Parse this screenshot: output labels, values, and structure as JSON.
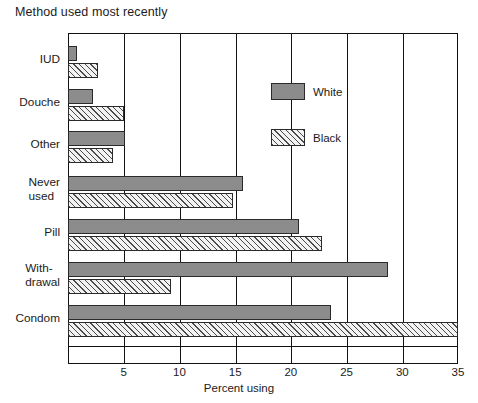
{
  "chart_data": {
    "type": "bar",
    "orientation": "horizontal",
    "title": "Method used most recently",
    "xlabel": "Percent using",
    "ylabel": "",
    "xlim": [
      0,
      35
    ],
    "xticks": [
      5,
      10,
      15,
      20,
      25,
      30,
      35
    ],
    "xticklabels": [
      "5",
      "10",
      "15",
      "20",
      "25",
      "30",
      "35"
    ],
    "grid": true,
    "grid_axis": "x",
    "legend_position": "upper-center-inside",
    "categories": [
      "IUD",
      "Douche",
      "Other",
      "Never used",
      "Pill",
      "With-drawal",
      "Condom"
    ],
    "category_label_lines": [
      [
        "IUD"
      ],
      [
        "Douche"
      ],
      [
        "Other"
      ],
      [
        "Never",
        "used"
      ],
      [
        "Pill"
      ],
      [
        "With-",
        "drawal"
      ],
      [
        "Condom"
      ]
    ],
    "series": [
      {
        "name": "White",
        "fill": "solid-gray",
        "color": "#8c8c8c",
        "values": [
          0.8,
          2.2,
          5.1,
          15.7,
          20.7,
          28.7,
          23.6
        ]
      },
      {
        "name": "Black",
        "fill": "diagonal-hatch",
        "color": "#f2f2f2",
        "values": [
          2.7,
          5.0,
          4.0,
          14.8,
          22.8,
          9.2,
          35.0
        ]
      }
    ]
  },
  "legend": {
    "entries": [
      {
        "label": "White"
      },
      {
        "label": "Black"
      }
    ]
  }
}
